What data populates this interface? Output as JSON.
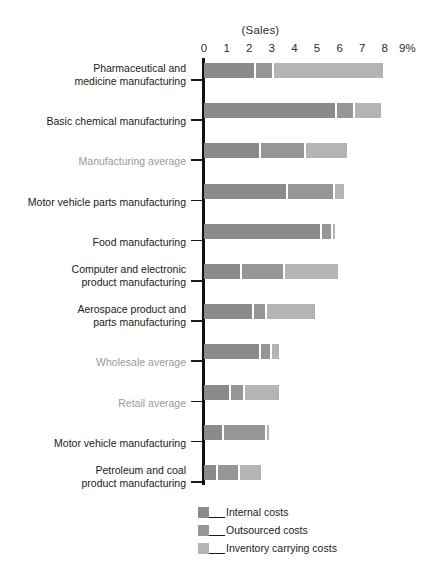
{
  "chart_data": {
    "type": "bar",
    "orientation": "horizontal",
    "stacked": true,
    "title": "(Sales)",
    "xlabel": "",
    "ylabel": "",
    "xlim": [
      0,
      9
    ],
    "grid": false,
    "legend_position": "bottom",
    "axis": {
      "tick_labels": [
        "0",
        "1",
        "2",
        "3",
        "4",
        "5",
        "6",
        "7",
        "8",
        "9%"
      ],
      "tick_values": [
        0,
        1,
        2,
        3,
        4,
        5,
        6,
        7,
        8,
        9
      ]
    },
    "categories": [
      "Pharmaceutical and\nmedicine manufacturing",
      "Basic chemical manufacturing",
      "Manufacturing average",
      "Motor vehicle parts manufacturing",
      "Food manufacturing",
      "Computer and electronic\nproduct manufacturing",
      "Aerospace product and\nparts manufacturing",
      "Wholesale average",
      "Retail average",
      "Motor vehicle manufacturing",
      "Petroleum and coal\nproduct manufacturing"
    ],
    "category_styles": [
      "normal",
      "normal",
      "muted",
      "normal",
      "normal",
      "normal",
      "normal",
      "muted",
      "muted",
      "normal",
      "normal"
    ],
    "series": [
      {
        "name": "Internal costs",
        "color": "#8a8a8a",
        "values": [
          2.3,
          5.9,
          2.5,
          3.7,
          5.2,
          1.7,
          2.2,
          2.5,
          1.2,
          0.9,
          0.6
        ]
      },
      {
        "name": "Outsourced costs",
        "color": "#969696",
        "values": [
          0.8,
          0.8,
          2.0,
          2.1,
          0.5,
          1.9,
          0.6,
          0.5,
          0.6,
          1.9,
          1.0
        ]
      },
      {
        "name": "Inventory carrying costs",
        "color": "#b4b4b4",
        "values": [
          4.9,
          1.2,
          1.9,
          0.5,
          0.2,
          2.4,
          2.2,
          0.4,
          1.6,
          0.1,
          1.0
        ]
      }
    ],
    "totals": [
      8.0,
      7.9,
      6.4,
      6.3,
      5.9,
      6.0,
      5.0,
      3.4,
      3.4,
      2.9,
      2.6
    ]
  },
  "legend": {
    "items": [
      {
        "label": "Internal costs",
        "color": "#8a8a8a"
      },
      {
        "label": "Outsourced costs",
        "color": "#969696"
      },
      {
        "label": "Inventory carrying costs",
        "color": "#b4b4b4"
      }
    ]
  },
  "colors": {
    "internal": "#8a8a8a",
    "outsourced": "#969696",
    "inventory": "#b4b4b4",
    "axis": "#111111",
    "text": "#1a1a1a",
    "muted_text": "#9a9a9a",
    "background": "#ffffff"
  }
}
